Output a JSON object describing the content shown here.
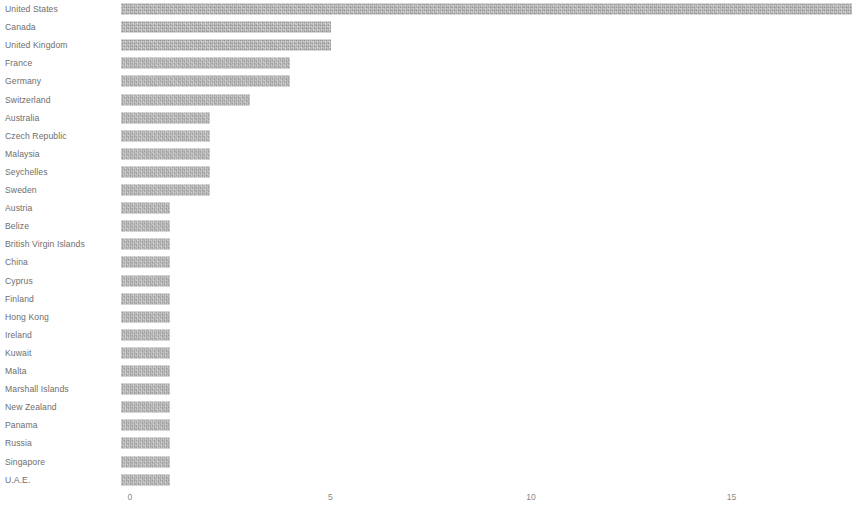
{
  "chart_data": {
    "type": "bar",
    "orientation": "horizontal",
    "title": "",
    "subtitle": "",
    "xlabel": "",
    "ylabel": "",
    "xlim": [
      0,
      18.05
    ],
    "xticks": [
      0,
      5,
      10,
      15
    ],
    "xtick_labels": [
      "0",
      "5",
      "10",
      "15"
    ],
    "grid": false,
    "legend": false,
    "bar_color": "#a9a9a9",
    "label_color": "#6e6e6e",
    "tick_color": "#8a8a8a",
    "background_color": "#ffffff",
    "categories": [
      "United States",
      "Canada",
      "United Kingdom",
      "France",
      "Germany",
      "Switzerland",
      "Australia",
      "Czech Republic",
      "Malaysia",
      "Seychelles",
      "Sweden",
      "Austria",
      "Belize",
      "British Virgin Islands",
      "China",
      "Cyprus",
      "Finland",
      "Hong Kong",
      "Ireland",
      "Kuwait",
      "Malta",
      "Marshall Islands",
      "New Zealand",
      "Panama",
      "Russia",
      "Singapore",
      "U.A.E."
    ],
    "values": [
      18,
      5,
      5,
      4,
      4,
      3,
      2,
      2,
      2,
      2,
      2,
      1,
      1,
      1,
      1,
      1,
      1,
      1,
      1,
      1,
      1,
      1,
      1,
      1,
      1,
      1,
      1
    ]
  }
}
